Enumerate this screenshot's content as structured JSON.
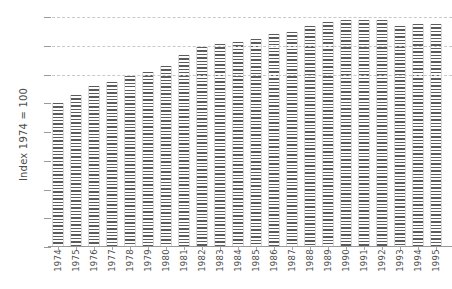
{
  "chart_data": {
    "type": "bar",
    "title": "",
    "subtitle": "",
    "xlabel": "",
    "ylabel": "Index 1974 = 100",
    "ylim": [
      0,
      165
    ],
    "yticks": [
      0,
      20,
      40,
      60,
      80,
      100,
      120,
      140,
      160
    ],
    "ytick_labels": [
      "0",
      "20",
      "40",
      "60",
      "80",
      "100",
      "120",
      "140",
      "160"
    ],
    "gridlines": [
      120,
      140,
      160
    ],
    "grid": true,
    "legend": null,
    "bar_style": "horizontal-hatch",
    "bar_color": "#5b5b5b",
    "categories": [
      "1974",
      "1975",
      "1976",
      "1977",
      "1978",
      "1979",
      "1980",
      "1981",
      "1982",
      "1983",
      "1984",
      "1985",
      "1986",
      "1987",
      "1988",
      "1989",
      "1990",
      "1991",
      "1992",
      "1993",
      "1994",
      "1995"
    ],
    "values": [
      100,
      106,
      112,
      115,
      119,
      122,
      126,
      134,
      139,
      141,
      143,
      145,
      148,
      150,
      154,
      157,
      158,
      158,
      158,
      154,
      155,
      155
    ]
  },
  "axis": {
    "y_title": "Index 1974 = 100"
  }
}
